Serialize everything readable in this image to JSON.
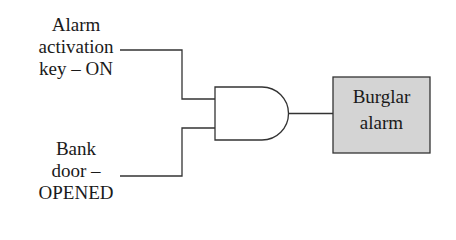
{
  "diagram": {
    "type": "logic-gate-circuit",
    "gate": {
      "kind": "AND",
      "inputs": 2
    },
    "inputs": [
      {
        "id": "input-1",
        "lines": [
          "Alarm",
          "activation",
          "key – ON"
        ]
      },
      {
        "id": "input-2",
        "lines": [
          "Bank",
          "door –",
          "OPENED"
        ]
      }
    ],
    "output": {
      "lines": [
        "Burglar",
        "alarm"
      ],
      "fill_color": "#d4d4d4",
      "border_color": "#333333"
    },
    "line_color": "#333333"
  }
}
